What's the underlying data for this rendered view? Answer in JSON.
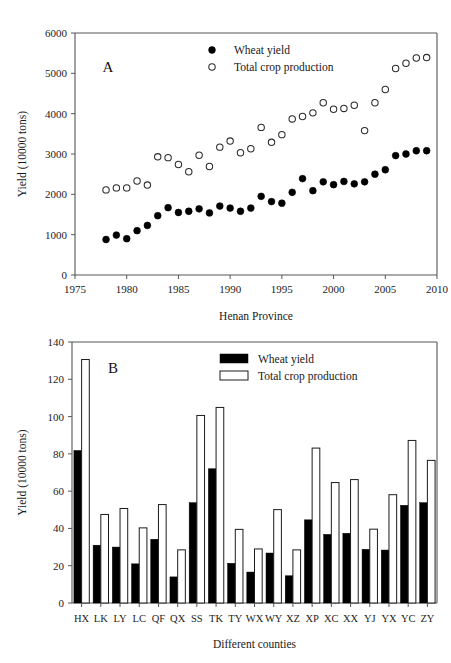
{
  "figure": {
    "panel_a_letter": "A",
    "panel_b_letter": "B"
  },
  "chart_data": [
    {
      "id": "panel-a",
      "type": "scatter",
      "title": "",
      "panel_label": "A",
      "xlabel": "Henan Province",
      "ylabel": "Yield (10000 tons)",
      "xlim": [
        1975,
        2010
      ],
      "ylim": [
        0,
        6000
      ],
      "xticks": [
        1975,
        1980,
        1985,
        1990,
        1995,
        2000,
        2005,
        2010
      ],
      "xtick_labels": [
        "1975",
        "1980",
        "1985",
        "1990",
        "1995",
        "2000",
        "2005",
        "2010"
      ],
      "yticks": [
        0,
        1000,
        2000,
        3000,
        4000,
        5000,
        6000
      ],
      "ytick_labels": [
        "0",
        "1000",
        "2000",
        "3000",
        "4000",
        "5000",
        "6000"
      ],
      "grid": false,
      "legend_position": "top-center",
      "x": [
        1978,
        1979,
        1980,
        1981,
        1982,
        1983,
        1984,
        1985,
        1986,
        1987,
        1988,
        1989,
        1990,
        1991,
        1992,
        1993,
        1994,
        1995,
        1996,
        1997,
        1998,
        1999,
        2000,
        2001,
        2002,
        2003,
        2004,
        2005,
        2006,
        2007,
        2008,
        2009
      ],
      "series": [
        {
          "name": "Wheat yield",
          "marker": "filled-circle",
          "values": [
            880,
            990,
            900,
            1100,
            1230,
            1470,
            1670,
            1550,
            1580,
            1640,
            1540,
            1710,
            1660,
            1580,
            1660,
            1950,
            1820,
            1780,
            2050,
            2390,
            2090,
            2310,
            2240,
            2320,
            2260,
            2310,
            2500,
            2610,
            2960,
            3000,
            3080,
            3080
          ]
        },
        {
          "name": "Total crop production",
          "marker": "open-circle",
          "values": [
            2110,
            2160,
            2160,
            2330,
            2230,
            2930,
            2910,
            2740,
            2560,
            2970,
            2690,
            3170,
            3320,
            3030,
            3130,
            3660,
            3290,
            3480,
            3870,
            3930,
            4020,
            4270,
            4110,
            4130,
            4210,
            3580,
            4270,
            4600,
            5120,
            5250,
            5380,
            5390
          ]
        }
      ]
    },
    {
      "id": "panel-b",
      "type": "bar",
      "title": "",
      "panel_label": "B",
      "xlabel": "Different counties",
      "ylabel": "Yield (10000 tons)",
      "ylim": [
        0,
        140
      ],
      "yticks": [
        0,
        20,
        40,
        60,
        80,
        100,
        120,
        140
      ],
      "ytick_labels": [
        "0",
        "20",
        "40",
        "60",
        "80",
        "100",
        "120",
        "140"
      ],
      "grid": false,
      "legend_position": "top-center",
      "categories": [
        "HX",
        "LK",
        "LY",
        "LC",
        "QF",
        "QX",
        "SS",
        "TK",
        "TY",
        "WX",
        "WY",
        "XZ",
        "XP",
        "XC",
        "XX",
        "YJ",
        "YX",
        "YC",
        "ZY"
      ],
      "series": [
        {
          "name": "Wheat yield",
          "style": "filled",
          "values": [
            81.8,
            31.0,
            30.0,
            21.0,
            34.2,
            14.0,
            53.8,
            72.0,
            21.3,
            16.6,
            26.8,
            14.6,
            44.6,
            36.8,
            37.4,
            28.8,
            28.4,
            52.4,
            53.8
          ]
        },
        {
          "name": "Total crop production",
          "style": "open",
          "values": [
            130.6,
            47.5,
            50.7,
            40.3,
            52.8,
            28.5,
            100.6,
            104.9,
            39.5,
            29.0,
            50.1,
            28.5,
            83.1,
            64.6,
            66.2,
            39.6,
            58.1,
            87.2,
            76.5
          ]
        }
      ]
    }
  ]
}
